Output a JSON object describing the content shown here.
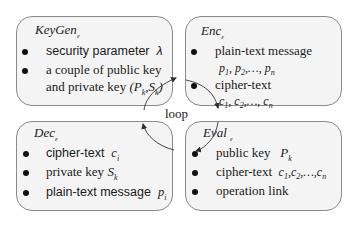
{
  "boxes": {
    "keygen": {
      "title": "KeyGen",
      "title_sub": "ε",
      "items": [
        {
          "text": "security parameter",
          "math": "λ"
        },
        {
          "text": "a couple of public key",
          "math": ""
        },
        {
          "text": "and private key",
          "math": "(Pk,Sk)"
        }
      ]
    },
    "enc": {
      "title": "Enc",
      "title_sub": "ε",
      "items": [
        {
          "text": "plain-text message",
          "math": "p1, p2,…, pn"
        },
        {
          "text": "cipher-text",
          "math": "c1, c2,…, cn"
        }
      ]
    },
    "dec": {
      "title": "Dec",
      "title_sub": "ε",
      "items": [
        {
          "text": "cipher-text",
          "math": "ci"
        },
        {
          "text": "private key",
          "math": "Sk"
        },
        {
          "text": "plain-text message",
          "math": "pi"
        }
      ]
    },
    "eval": {
      "title": "Eval",
      "title_sub": "ε",
      "items": [
        {
          "text": "public key",
          "math": "Pk"
        },
        {
          "text": "cipher-text",
          "math": "c1,c2,…,cn"
        },
        {
          "text": "operation link",
          "math": ""
        }
      ]
    }
  },
  "center_label": "loop",
  "colors": {
    "box_fill": "#f4f4f4",
    "box_border": "#8a8a8a",
    "text": "#1a1a1a",
    "arrow": "#333333"
  }
}
